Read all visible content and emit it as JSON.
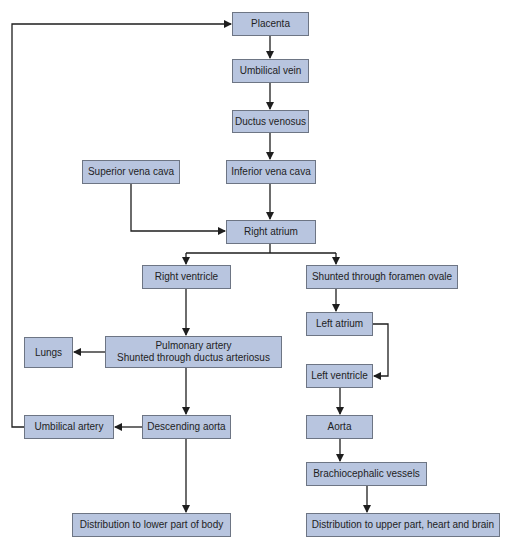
{
  "diagram": {
    "title": "",
    "colors": {
      "box_fill": "#b8c5df",
      "box_border": "#6d7584",
      "line": "#1e1e1e",
      "background": "#ffffff"
    },
    "nodes": {
      "placenta": "Placenta",
      "umbilical_vein": "Umbilical vein",
      "ductus_venosus": "Ductus venosus",
      "superior_vena_cava": "Superior vena cava",
      "inferior_vena_cava": "Inferior vena cava",
      "right_atrium": "Right atrium",
      "right_ventricle": "Right ventricle",
      "foramen_ovale": "Shunted through foramen ovale",
      "left_atrium": "Left atrium",
      "pulmonary_artery_line1": "Pulmonary artery",
      "pulmonary_artery_line2": "Shunted through ductus arteriosus",
      "lungs": "Lungs",
      "left_ventricle": "Left ventricle",
      "umbilical_artery": "Umbilical artery",
      "descending_aorta": "Descending aorta",
      "aorta": "Aorta",
      "brachiocephalic_vessels": "Brachiocephalic vessels",
      "distribution_lower": "Distribution to lower part of body",
      "distribution_upper": "Distribution to upper part, heart and brain"
    },
    "edges": [
      [
        "placenta",
        "umbilical_vein"
      ],
      [
        "umbilical_vein",
        "ductus_venosus"
      ],
      [
        "ductus_venosus",
        "inferior_vena_cava"
      ],
      [
        "inferior_vena_cava",
        "right_atrium"
      ],
      [
        "superior_vena_cava",
        "right_atrium"
      ],
      [
        "right_atrium",
        "right_ventricle"
      ],
      [
        "right_atrium",
        "foramen_ovale"
      ],
      [
        "foramen_ovale",
        "left_atrium"
      ],
      [
        "left_atrium",
        "left_ventricle"
      ],
      [
        "right_ventricle",
        "pulmonary_artery"
      ],
      [
        "pulmonary_artery",
        "lungs"
      ],
      [
        "pulmonary_artery",
        "descending_aorta"
      ],
      [
        "descending_aorta",
        "umbilical_artery"
      ],
      [
        "umbilical_artery",
        "placenta"
      ],
      [
        "descending_aorta",
        "distribution_lower"
      ],
      [
        "left_ventricle",
        "aorta"
      ],
      [
        "aorta",
        "brachiocephalic_vessels"
      ],
      [
        "brachiocephalic_vessels",
        "distribution_upper"
      ]
    ]
  }
}
